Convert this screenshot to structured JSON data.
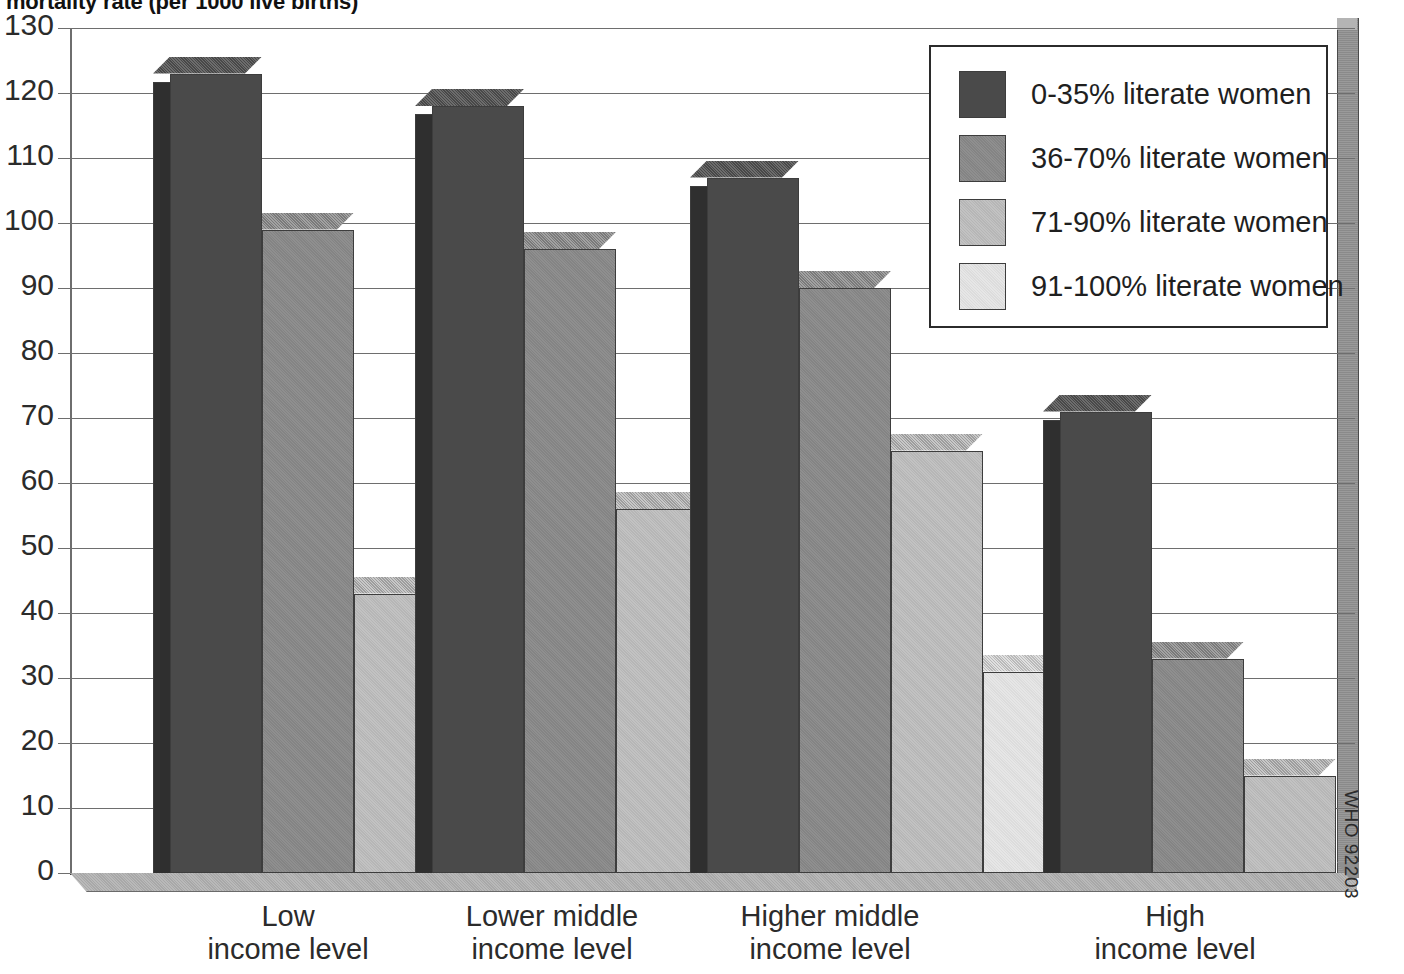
{
  "chart_data": {
    "type": "bar",
    "title": "mortality rate (per 1000 live births)",
    "xlabel": "",
    "ylabel": "",
    "ylim": [
      0,
      130
    ],
    "ytick_step": 10,
    "yticks": [
      "130",
      "120",
      "110",
      "100",
      "90",
      "80",
      "70",
      "60",
      "50",
      "40",
      "30",
      "20",
      "10",
      "0"
    ],
    "grid": true,
    "legend_position": "top-right",
    "style": "3d-grouped-column",
    "categories": [
      "Low income level",
      "Lower middle income level",
      "Higher middle income level",
      "High income level"
    ],
    "category_lines": [
      [
        "Low",
        "income level"
      ],
      [
        "Lower middle",
        "income level"
      ],
      [
        "Higher middle",
        "income level"
      ],
      [
        "High",
        "income level"
      ]
    ],
    "series": [
      {
        "name": "0-35% literate women",
        "color": "#4a4a4a",
        "values": [
          123,
          118,
          107,
          71
        ]
      },
      {
        "name": "36-70% literate women",
        "color": "#8f8f8f",
        "values": [
          99,
          96,
          90,
          33
        ]
      },
      {
        "name": "71-90% literate women",
        "color": "#c2c2c2",
        "values": [
          43,
          56,
          65,
          15
        ]
      },
      {
        "name": "91-100% literate women",
        "color": "#e6e6e6",
        "values": [
          null,
          50,
          31,
          null
        ]
      }
    ],
    "annotations": [
      "WHO 92203"
    ]
  },
  "legend": {
    "items": [
      {
        "label": "0-35% literate women"
      },
      {
        "label": "36-70% literate women"
      },
      {
        "label": "71-90% literate women"
      },
      {
        "label": "91-100% literate women"
      }
    ]
  },
  "credit": "WHO 92203"
}
